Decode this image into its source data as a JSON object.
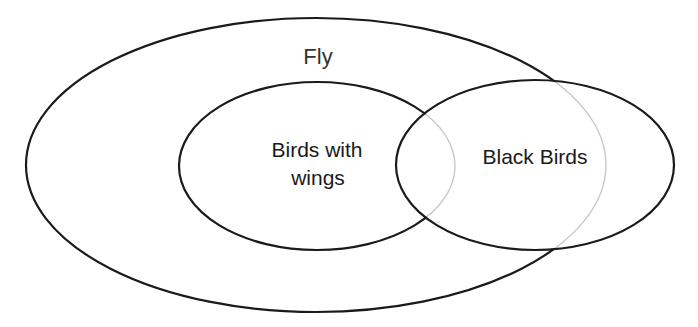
{
  "diagram": {
    "type": "venn",
    "sets": [
      {
        "id": "fly",
        "label": "Fly",
        "shape": {
          "cx": 316,
          "cy": 165,
          "rx": 290,
          "ry": 147
        }
      },
      {
        "id": "birds-with-wings",
        "label_lines": [
          "Birds with",
          "wings"
        ],
        "shape": {
          "cx": 317,
          "cy": 166,
          "rx": 138,
          "ry": 84
        },
        "contained_in": "fly"
      },
      {
        "id": "black-birds",
        "label": "Black Birds",
        "shape": {
          "cx": 535,
          "cy": 165,
          "rx": 139,
          "ry": 85
        },
        "overlaps": [
          "fly",
          "birds-with-wings"
        ]
      }
    ],
    "colors": {
      "stroke": "#1a1a1a",
      "hidden_stroke": "#c8c8c8",
      "background": "#ffffff"
    }
  }
}
